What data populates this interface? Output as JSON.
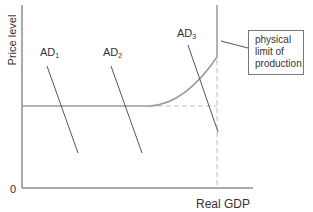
{
  "diagram": {
    "type": "aggregate demand / aggregate supply diagram",
    "axes": {
      "y_label": "Price level",
      "x_label": "Real GDP",
      "origin_label": "0"
    },
    "curves": {
      "ad1": {
        "label_main": "AD",
        "label_sub": "1"
      },
      "ad2": {
        "label_main": "AD",
        "label_sub": "2"
      },
      "ad3": {
        "label_main": "AD",
        "label_sub": "3"
      },
      "aggregate_supply": {
        "description": "horizontal segment, curving upward, then vertical at physical limit of production"
      }
    },
    "annotation": {
      "line1": "physical",
      "line2": "limit of",
      "line3": "production"
    },
    "colors": {
      "axis": "#555555",
      "ad_lines": "#555555",
      "supply_curve": "#999999",
      "dashed_guides": "#bbbbbb",
      "text": "#333333"
    }
  }
}
